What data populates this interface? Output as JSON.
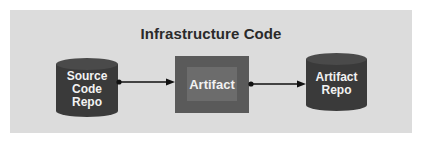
{
  "diagram": {
    "title": "Infrastructure Code",
    "nodes": [
      {
        "id": "source-code-repo",
        "shape": "cylinder",
        "lines": [
          "Source",
          "Code",
          "Repo"
        ]
      },
      {
        "id": "artifact",
        "shape": "nested-box",
        "label": "Artifact"
      },
      {
        "id": "artifact-repo",
        "shape": "cylinder",
        "lines": [
          "Artifact",
          "Repo"
        ]
      }
    ],
    "edges": [
      {
        "from": "source-code-repo",
        "to": "artifact",
        "start": "dot",
        "end": "arrow"
      },
      {
        "from": "artifact",
        "to": "artifact-repo",
        "start": "dot",
        "end": "arrow"
      }
    ],
    "colors": {
      "panel": "#dcdcdc",
      "cylinder": "#3a3a3a",
      "cylinder_top": "#4a4a4a",
      "artifact_outer": "#5a5a5a",
      "artifact_inner": "#6c6c6c",
      "label_text": "#f2f2f2",
      "title_text": "#2a2a2a",
      "connector": "#111111"
    }
  }
}
